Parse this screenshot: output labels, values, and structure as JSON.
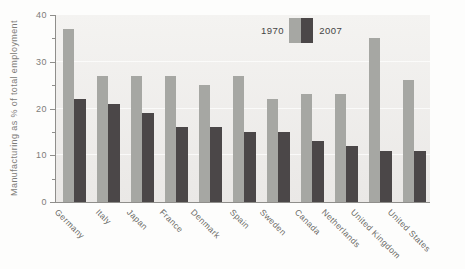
{
  "chart_data": {
    "type": "bar",
    "title": "",
    "ylabel": "Manufacturing as % of total employment",
    "xlabel": "",
    "ylim": [
      0,
      40
    ],
    "yticks": [
      0,
      10,
      20,
      30,
      40
    ],
    "ytick_minor_interval": 5,
    "grid": "faint-white-horizontal",
    "legend_position": "top-center-inside",
    "categories": [
      "Germany",
      "Italy",
      "Japan",
      "France",
      "Denmark",
      "Spain",
      "Sweden",
      "Canada",
      "Netherlands",
      "United Kingdom",
      "United States"
    ],
    "series": [
      {
        "name": "1970",
        "color": "#a6a7a3",
        "values": [
          37,
          27,
          27,
          27,
          25,
          27,
          22,
          23,
          23,
          35,
          26
        ]
      },
      {
        "name": "2007",
        "color": "#4b4748",
        "values": [
          22,
          21,
          19,
          16,
          16,
          15,
          15,
          13,
          12,
          11,
          11
        ]
      }
    ],
    "colors": {
      "plot_bg_top": "#f4f3f1",
      "plot_bg_bottom": "#eae8e6",
      "axis": "#8f8e8b",
      "y_tick_label": "#7d7c79",
      "x_tick_label": "#696965",
      "legend_text": "#454545"
    }
  }
}
